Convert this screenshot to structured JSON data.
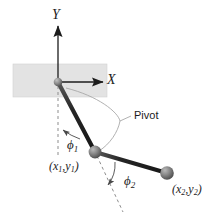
{
  "figure": {
    "background_color": "#ffffff",
    "wall_color": "#e3e3e3",
    "line_color": "#222222",
    "dashed_color": "#7a7a7a",
    "leader_color": "#9a9a9a",
    "mass_color": "#666666",
    "labels": {
      "y_axis": "Y",
      "x_axis": "X",
      "pivot": "Pivot",
      "phi1": "ϕ",
      "phi1_sub": "1",
      "phi2": "ϕ",
      "phi2_sub": "2",
      "coord1_open": "(",
      "coord1_x": "x",
      "coord1_xsub": "1",
      "coord1_comma": ",",
      "coord1_y": "y",
      "coord1_ysub": "1",
      "coord1_close": ")",
      "coord2_open": "(",
      "coord2_x": "x",
      "coord2_xsub": "2",
      "coord2_comma": ",",
      "coord2_y": "y",
      "coord2_ysub": "2",
      "coord2_close": ")"
    },
    "geometry": {
      "origin": [
        58,
        82
      ],
      "mass1": [
        95,
        152
      ],
      "mass2": [
        167,
        173
      ],
      "wall_rect": [
        13,
        64,
        94,
        33
      ],
      "y_axis_tip": [
        58,
        26
      ],
      "x_axis_tip": [
        104,
        82
      ]
    }
  }
}
